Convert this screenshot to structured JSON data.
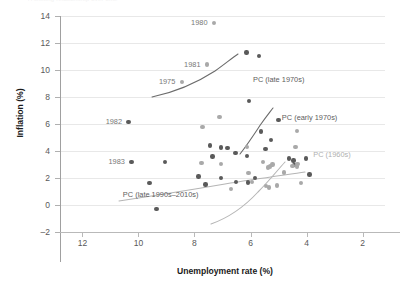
{
  "figure": {
    "top_clipped_text": "A shifting relationship over time",
    "x_title": "Unemployment rate (%)",
    "y_title": "Inflation (%)"
  },
  "chart_data": {
    "type": "scatter",
    "title": "",
    "xlabel": "Unemployment rate (%)",
    "ylabel": "Inflation (%)",
    "xlim": [
      12.8,
      1.2
    ],
    "ylim": [
      -2,
      14
    ],
    "x_reversed": true,
    "grid": "horizontal",
    "legend": "none",
    "xticks": [
      12,
      10,
      8,
      6,
      4,
      2
    ],
    "yticks": [
      -2,
      0,
      2,
      4,
      6,
      8,
      10,
      12,
      14
    ],
    "colors": {
      "dark_point": "#5a5a5a",
      "light_point": "#a9a9a9",
      "curve_dark": "#6b6b6b",
      "curve_light": "#b5b5b5",
      "gridline": "#e8e8e8",
      "axis": "#b0b0b0",
      "text": "#595959"
    },
    "series": [
      {
        "name": "Early period (dark markers)",
        "marker": "dark",
        "points": [
          {
            "x": 7.44,
            "y": 4.4
          },
          {
            "x": 7.05,
            "y": 4.25
          },
          {
            "x": 7.36,
            "y": 3.58
          },
          {
            "x": 6.82,
            "y": 4.22
          },
          {
            "x": 6.12,
            "y": 3.62
          },
          {
            "x": 6.05,
            "y": 7.7
          },
          {
            "x": 6.14,
            "y": 11.3
          },
          {
            "x": 5.7,
            "y": 11.05
          },
          {
            "x": 5.62,
            "y": 5.45
          },
          {
            "x": 5.47,
            "y": 4.15
          },
          {
            "x": 5.27,
            "y": 4.82
          },
          {
            "x": 5.0,
            "y": 6.3
          },
          {
            "x": 4.63,
            "y": 3.45
          },
          {
            "x": 4.47,
            "y": 3.3
          },
          {
            "x": 4.43,
            "y": 2.95
          },
          {
            "x": 4.03,
            "y": 3.45
          },
          {
            "x": 3.9,
            "y": 2.25
          },
          {
            "x": 6.53,
            "y": 3.85
          },
          {
            "x": 7.6,
            "y": 1.52
          },
          {
            "x": 7.05,
            "y": 1.98
          },
          {
            "x": 6.1,
            "y": 1.68
          },
          {
            "x": 6.52,
            "y": 1.7
          },
          {
            "x": 9.6,
            "y": 1.65
          },
          {
            "x": 9.35,
            "y": -0.3
          },
          {
            "x": 10.35,
            "y": 6.15
          },
          {
            "x": 10.25,
            "y": 3.18
          },
          {
            "x": 9.05,
            "y": 3.18
          },
          {
            "x": 7.85,
            "y": 2.1
          },
          {
            "x": 5.85,
            "y": 2.0
          }
        ]
      },
      {
        "name": "Later period (light markers)",
        "marker": "light",
        "points": [
          {
            "x": 7.3,
            "y": 13.5
          },
          {
            "x": 7.55,
            "y": 10.4
          },
          {
            "x": 8.45,
            "y": 9.1
          },
          {
            "x": 7.1,
            "y": 6.5
          },
          {
            "x": 7.72,
            "y": 5.8
          },
          {
            "x": 6.12,
            "y": 4.28
          },
          {
            "x": 4.35,
            "y": 5.48
          },
          {
            "x": 4.4,
            "y": 4.28
          },
          {
            "x": 6.07,
            "y": 2.38
          },
          {
            "x": 5.55,
            "y": 3.2
          },
          {
            "x": 5.38,
            "y": 2.78
          },
          {
            "x": 5.3,
            "y": 2.85
          },
          {
            "x": 5.22,
            "y": 3.0
          },
          {
            "x": 4.8,
            "y": 2.4
          },
          {
            "x": 4.5,
            "y": 2.9
          },
          {
            "x": 4.32,
            "y": 3.05
          },
          {
            "x": 4.33,
            "y": 2.85
          },
          {
            "x": 5.35,
            "y": 1.3
          },
          {
            "x": 5.05,
            "y": 1.45
          },
          {
            "x": 4.2,
            "y": 1.65
          },
          {
            "x": 7.75,
            "y": 3.1
          },
          {
            "x": 7.05,
            "y": 3.02
          },
          {
            "x": 6.7,
            "y": 1.18
          },
          {
            "x": 5.95,
            "y": 1.72
          },
          {
            "x": 5.45,
            "y": 1.42
          }
        ]
      }
    ],
    "curves": [
      {
        "name": "PC (late 1970s)",
        "shade": "dark"
      },
      {
        "name": "PC (early 1970s)",
        "shade": "dark"
      },
      {
        "name": "PC (1960s)",
        "shade": "light"
      },
      {
        "name": "PC (late 1990s–2010s)",
        "shade": "light"
      }
    ],
    "annotations": [
      {
        "label": "1980",
        "x": 7.3,
        "y": 13.5
      },
      {
        "label": "1981",
        "x": 7.55,
        "y": 10.4
      },
      {
        "label": "1975",
        "x": 8.45,
        "y": 9.1
      },
      {
        "label": "1982",
        "x": 10.35,
        "y": 6.15
      },
      {
        "label": "1983",
        "x": 10.25,
        "y": 3.18
      },
      {
        "label": "PC (late 1970s)",
        "x": 5.0,
        "y": 9.3
      },
      {
        "label": "PC (early 1970s)",
        "x": 3.9,
        "y": 6.5
      },
      {
        "label": "PC (1960s)",
        "x": 3.1,
        "y": 3.75
      },
      {
        "label": "PC (late 1990s–2010s)",
        "x": 9.2,
        "y": 0.85
      }
    ]
  },
  "axis": {
    "y_labels": [
      "14",
      "12",
      "10",
      "8",
      "6",
      "4",
      "2",
      "0",
      "-2"
    ],
    "x_labels": [
      "12",
      "10",
      "8",
      "6",
      "4",
      "2"
    ]
  },
  "annotations_text": {
    "y1980": "1980",
    "y1981": "1981",
    "y1975": "1975",
    "y1982": "1982",
    "y1983": "1983",
    "pc_late1970s": "PC (late 1970s)",
    "pc_early1970s": "PC (early 1970s)",
    "pc_1960s": "PC (1960s)",
    "pc_late1990s": "PC (late 1990s–2010s)"
  }
}
